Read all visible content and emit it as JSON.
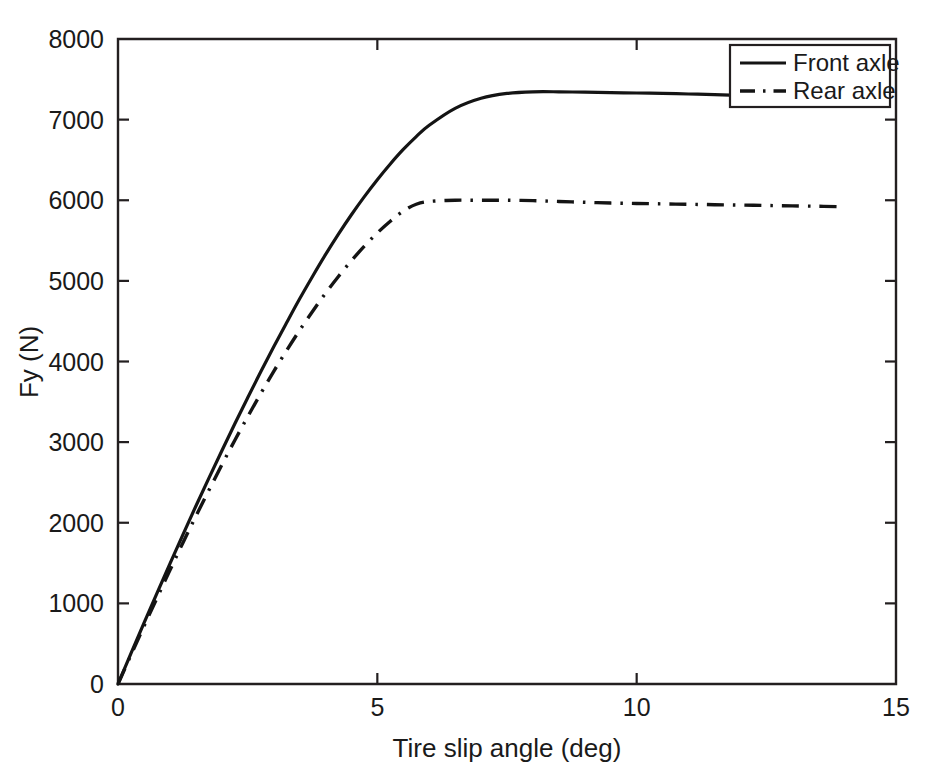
{
  "figure": {
    "background_color": "#ffffff",
    "line_color": "#141414",
    "axis_color": "#231f20"
  },
  "axes": {
    "x_title": "Tire slip angle (deg)",
    "y_title": "Fy (N)",
    "x_ticks": [
      "0",
      "5",
      "10",
      "15"
    ],
    "y_ticks": [
      "0",
      "1000",
      "2000",
      "3000",
      "4000",
      "5000",
      "6000",
      "7000",
      "8000"
    ]
  },
  "legend": {
    "entries": [
      {
        "label": "Front axle",
        "style": "solid"
      },
      {
        "label": "Rear axle",
        "style": "dash-dot"
      }
    ]
  },
  "chart_data": {
    "type": "line",
    "title": "",
    "xlabel": "Tire slip angle (deg)",
    "ylabel": "Fy (N)",
    "xlim": [
      0,
      15
    ],
    "ylim": [
      0,
      8000
    ],
    "xticks": [
      0,
      5,
      10,
      15
    ],
    "yticks": [
      0,
      1000,
      2000,
      3000,
      4000,
      5000,
      6000,
      7000,
      8000
    ],
    "grid": false,
    "legend_position": "upper right",
    "series": [
      {
        "name": "Front axle",
        "style": "solid",
        "color": "#141414",
        "x": [
          0,
          0.25,
          0.5,
          0.75,
          1,
          1.25,
          1.5,
          1.75,
          2,
          2.25,
          2.5,
          2.75,
          3,
          3.25,
          3.5,
          3.75,
          4,
          4.25,
          4.5,
          4.75,
          5,
          5.25,
          5.5,
          5.75,
          6,
          6.5,
          7,
          7.5,
          8,
          8.5,
          9,
          9.5,
          10,
          10.5,
          11,
          11.5,
          11.8
        ],
        "y": [
          0,
          380,
          755,
          1125,
          1490,
          1850,
          2205,
          2550,
          2890,
          3225,
          3550,
          3870,
          4180,
          4480,
          4775,
          5055,
          5325,
          5580,
          5820,
          6045,
          6255,
          6450,
          6630,
          6790,
          6930,
          7140,
          7265,
          7325,
          7345,
          7345,
          7340,
          7335,
          7330,
          7325,
          7318,
          7310,
          7305
        ]
      },
      {
        "name": "Rear axle",
        "style": "dash-dot",
        "color": "#141414",
        "x": [
          0,
          0.25,
          0.5,
          0.75,
          1,
          1.25,
          1.5,
          1.75,
          2,
          2.25,
          2.5,
          2.75,
          3,
          3.25,
          3.5,
          3.75,
          4,
          4.25,
          4.5,
          4.75,
          5,
          5.25,
          5.5,
          5.75,
          6,
          6.5,
          7,
          7.5,
          8,
          8.5,
          9,
          9.5,
          10,
          10.5,
          11,
          11.5,
          12,
          12.5,
          13,
          13.5,
          13.9
        ],
        "y": [
          0,
          360,
          715,
          1065,
          1410,
          1750,
          2080,
          2400,
          2715,
          3020,
          3315,
          3600,
          3875,
          4135,
          4385,
          4620,
          4845,
          5055,
          5250,
          5430,
          5595,
          5740,
          5865,
          5950,
          5985,
          6000,
          6000,
          6000,
          5995,
          5985,
          5975,
          5965,
          5960,
          5955,
          5950,
          5945,
          5940,
          5935,
          5930,
          5925,
          5920
        ]
      }
    ]
  }
}
